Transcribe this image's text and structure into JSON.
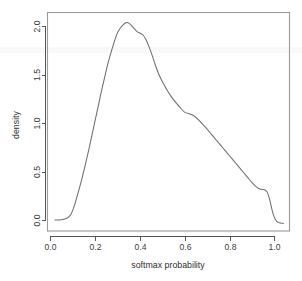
{
  "chart_data": {
    "type": "line",
    "title": "",
    "subtitle": "",
    "xlabel": "softmax probability",
    "ylabel": "density",
    "xlim": [
      -0.02,
      1.06
    ],
    "ylim": [
      -0.06,
      2.12
    ],
    "xticks": [
      0.0,
      0.2,
      0.4,
      0.6,
      0.8,
      1.0
    ],
    "xtick_labels": [
      "0.0",
      "0.2",
      "0.4",
      "0.6",
      "0.8",
      "1.0"
    ],
    "yticks": [
      0.0,
      0.5,
      1.0,
      1.5,
      2.0
    ],
    "ytick_labels": [
      "0.0",
      "0.5",
      "1.0",
      "1.5",
      "2.0"
    ],
    "grid": false,
    "legend": false,
    "legend_position": "none",
    "box_frame": true,
    "series": [
      {
        "name": "softmax probability density",
        "color": "#6e6e6e",
        "x": [
          0.02,
          0.04,
          0.055,
          0.07,
          0.08,
          0.09,
          0.1,
          0.11,
          0.125,
          0.14,
          0.155,
          0.17,
          0.185,
          0.2,
          0.215,
          0.23,
          0.245,
          0.26,
          0.275,
          0.29,
          0.3,
          0.312,
          0.325,
          0.338,
          0.35,
          0.362,
          0.375,
          0.388,
          0.4,
          0.412,
          0.425,
          0.44,
          0.455,
          0.47,
          0.485,
          0.5,
          0.52,
          0.54,
          0.56,
          0.58,
          0.6,
          0.62,
          0.64,
          0.66,
          0.68,
          0.7,
          0.72,
          0.74,
          0.76,
          0.78,
          0.8,
          0.82,
          0.84,
          0.86,
          0.88,
          0.9,
          0.915,
          0.93,
          0.945,
          0.958,
          0.968,
          0.978,
          0.988,
          0.998,
          1.01,
          1.025,
          1.04
        ],
        "y": [
          0.005,
          0.006,
          0.01,
          0.02,
          0.035,
          0.06,
          0.11,
          0.18,
          0.3,
          0.43,
          0.57,
          0.72,
          0.88,
          1.04,
          1.2,
          1.36,
          1.51,
          1.65,
          1.77,
          1.88,
          1.94,
          1.985,
          2.02,
          2.04,
          2.035,
          2.01,
          1.975,
          1.945,
          1.93,
          1.915,
          1.87,
          1.79,
          1.695,
          1.59,
          1.5,
          1.43,
          1.345,
          1.275,
          1.215,
          1.16,
          1.115,
          1.1,
          1.08,
          1.04,
          0.99,
          0.94,
          0.885,
          0.83,
          0.775,
          0.72,
          0.665,
          0.61,
          0.555,
          0.5,
          0.445,
          0.39,
          0.355,
          0.33,
          0.32,
          0.315,
          0.29,
          0.22,
          0.12,
          0.04,
          -0.01,
          -0.025,
          -0.03
        ]
      }
    ],
    "annotations": [],
    "peak": {
      "x": 0.338,
      "y": 2.04
    }
  },
  "figure": {
    "background_color": "#ffffff",
    "frame_color": "#9a9a9a",
    "axis_color": "#555555",
    "curve_color": "#6e6e6e"
  }
}
